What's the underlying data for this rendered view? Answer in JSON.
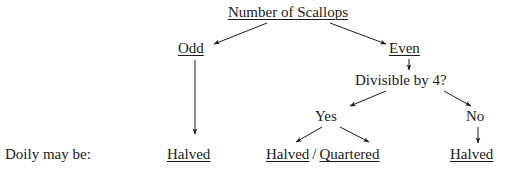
{
  "diagram": {
    "title": "Number of Scallops",
    "type": "decision-tree",
    "row_label": "Doily may be:",
    "nodes": [
      {
        "id": "root",
        "label": "Number of Scallops",
        "underlined": true,
        "x": 228,
        "y": 4,
        "level": 0
      },
      {
        "id": "odd",
        "label": "Odd",
        "underlined": true,
        "x": 178,
        "y": 40,
        "level": 1
      },
      {
        "id": "even",
        "label": "Even",
        "underlined": true,
        "x": 389,
        "y": 40,
        "level": 1
      },
      {
        "id": "div4",
        "label": "Divisible by 4?",
        "underlined": false,
        "x": 355,
        "y": 72,
        "level": 2
      },
      {
        "id": "yes",
        "label": "Yes",
        "underlined": false,
        "x": 315,
        "y": 108,
        "level": 3
      },
      {
        "id": "no",
        "label": "No",
        "underlined": false,
        "x": 466,
        "y": 108,
        "level": 3
      },
      {
        "id": "odd-result",
        "label": "Halved",
        "underlined": true,
        "x": 167,
        "y": 146,
        "level": 4
      },
      {
        "id": "no-result",
        "label": "Halved",
        "underlined": true,
        "x": 450,
        "y": 146,
        "level": 4
      }
    ],
    "compound_result": {
      "id": "yes-result",
      "x": 266,
      "y": 146,
      "parts": [
        {
          "text": "Halved",
          "underlined": true
        },
        {
          "text": "/",
          "underlined": false
        },
        {
          "text": "Quartered",
          "underlined": true
        }
      ]
    },
    "edges": [
      {
        "id": "root-to-odd",
        "from": "root",
        "to": "odd",
        "x1": 267,
        "y1": 23,
        "x2": 214,
        "y2": 44
      },
      {
        "id": "root-to-even",
        "from": "root",
        "to": "even",
        "x1": 330,
        "y1": 23,
        "x2": 386,
        "y2": 44
      },
      {
        "id": "odd-to-halved",
        "from": "odd",
        "to": "odd-result",
        "x1": 195,
        "y1": 60,
        "x2": 195,
        "y2": 134
      },
      {
        "id": "even-to-div4",
        "from": "even",
        "to": "div4",
        "x1": 409,
        "y1": 59,
        "x2": 409,
        "y2": 70
      },
      {
        "id": "div4-to-yes",
        "from": "div4",
        "to": "yes",
        "x1": 386,
        "y1": 91,
        "x2": 350,
        "y2": 106
      },
      {
        "id": "div4-to-no",
        "from": "div4",
        "to": "no",
        "x1": 444,
        "y1": 91,
        "x2": 471,
        "y2": 106
      },
      {
        "id": "yes-to-halved",
        "from": "yes",
        "to": "yes-result",
        "x1": 322,
        "y1": 127,
        "x2": 296,
        "y2": 142
      },
      {
        "id": "yes-to-quartered",
        "from": "yes",
        "to": "yes-result",
        "x1": 340,
        "y1": 127,
        "x2": 369,
        "y2": 142
      },
      {
        "id": "no-to-halved",
        "from": "no",
        "to": "no-result",
        "x1": 478,
        "y1": 127,
        "x2": 478,
        "y2": 143
      }
    ],
    "style": {
      "line_color": "#1a1a1a",
      "text_color": "#1a1a1a",
      "background": "#ffffff"
    }
  }
}
